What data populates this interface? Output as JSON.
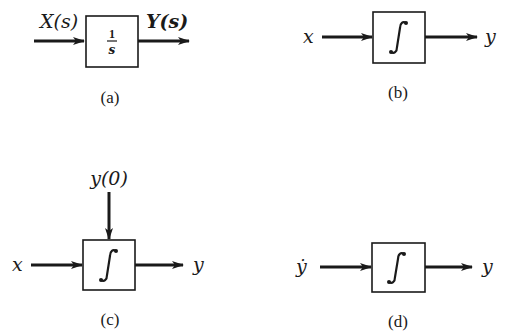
{
  "diagrams": {
    "a": {
      "caption": "(a)",
      "input_label": "X(s)",
      "output_label": "Y(s)",
      "block_numerator": "1",
      "block_denominator": "s"
    },
    "b": {
      "caption": "(b)",
      "input_label": "x",
      "output_label": "y",
      "block_symbol": "∫"
    },
    "c": {
      "caption": "(c)",
      "input_label": "x",
      "output_label": "y",
      "initial_condition_label": "y(0)",
      "block_symbol": "∫"
    },
    "d": {
      "caption": "(d)",
      "input_label": "ẏ",
      "output_label": "y",
      "block_symbol": "∫"
    }
  },
  "colors": {
    "stroke": "#1a1a1a",
    "background": "#ffffff"
  }
}
